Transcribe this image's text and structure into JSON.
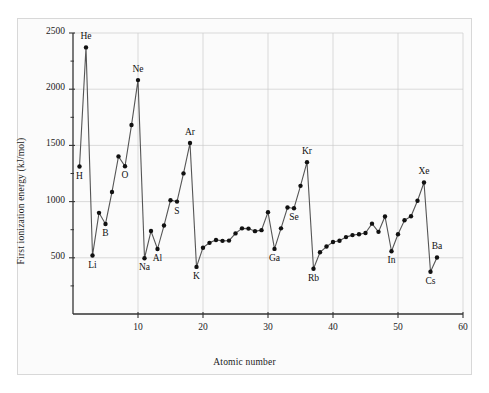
{
  "chart_data": {
    "type": "line",
    "title": "",
    "xlabel": "Atomic number",
    "ylabel": "First ionization energy (kJ/mol)",
    "xlim": [
      0,
      60
    ],
    "ylim": [
      0,
      2500
    ],
    "xticks": [
      10,
      20,
      30,
      40,
      50,
      60
    ],
    "yticks": [
      500,
      1000,
      1500,
      2000,
      2500
    ],
    "grid": true,
    "legend": null,
    "marker": "filled-circle",
    "line_color": "#555555",
    "marker_color": "#111111",
    "grid_color": "#cccccc",
    "x": [
      1,
      2,
      3,
      4,
      5,
      6,
      7,
      8,
      9,
      10,
      11,
      12,
      13,
      14,
      15,
      16,
      17,
      18,
      19,
      20,
      21,
      22,
      23,
      24,
      25,
      26,
      27,
      28,
      29,
      30,
      31,
      32,
      33,
      34,
      35,
      36,
      37,
      38,
      39,
      40,
      41,
      42,
      43,
      44,
      45,
      46,
      47,
      48,
      49,
      50,
      51,
      52,
      53,
      54,
      55,
      56
    ],
    "y": [
      1312,
      2372,
      520,
      900,
      801,
      1086,
      1402,
      1314,
      1681,
      2081,
      496,
      738,
      578,
      787,
      1012,
      1000,
      1251,
      1521,
      419,
      590,
      633,
      659,
      651,
      653,
      717,
      762,
      760,
      737,
      746,
      906,
      579,
      762,
      947,
      941,
      1140,
      1351,
      403,
      549,
      600,
      640,
      652,
      684,
      702,
      710,
      720,
      804,
      731,
      868,
      558,
      709,
      834,
      869,
      1008,
      1170,
      376,
      503
    ],
    "point_labels": [
      {
        "x": 1,
        "symbol": "H",
        "position": "below"
      },
      {
        "x": 2,
        "symbol": "He",
        "position": "above"
      },
      {
        "x": 3,
        "symbol": "Li",
        "position": "below"
      },
      {
        "x": 5,
        "symbol": "B",
        "position": "below"
      },
      {
        "x": 8,
        "symbol": "O",
        "position": "below"
      },
      {
        "x": 10,
        "symbol": "Ne",
        "position": "above"
      },
      {
        "x": 11,
        "symbol": "Na",
        "position": "below"
      },
      {
        "x": 13,
        "symbol": "Al",
        "position": "below"
      },
      {
        "x": 16,
        "symbol": "S",
        "position": "below"
      },
      {
        "x": 18,
        "symbol": "Ar",
        "position": "above"
      },
      {
        "x": 19,
        "symbol": "K",
        "position": "below"
      },
      {
        "x": 31,
        "symbol": "Ga",
        "position": "below"
      },
      {
        "x": 34,
        "symbol": "Se",
        "position": "below"
      },
      {
        "x": 36,
        "symbol": "Kr",
        "position": "above"
      },
      {
        "x": 37,
        "symbol": "Rb",
        "position": "below"
      },
      {
        "x": 49,
        "symbol": "In",
        "position": "below"
      },
      {
        "x": 54,
        "symbol": "Xe",
        "position": "above"
      },
      {
        "x": 55,
        "symbol": "Cs",
        "position": "below"
      },
      {
        "x": 56,
        "symbol": "Ba",
        "position": "above"
      }
    ]
  }
}
